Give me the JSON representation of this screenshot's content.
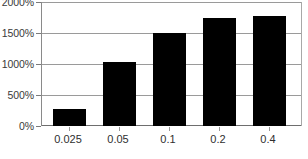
{
  "chart_data": {
    "type": "bar",
    "title": "",
    "subtitle": "",
    "xlabel": "",
    "ylabel": "",
    "categories": [
      "0.025",
      "0.05",
      "0.1",
      "0.2",
      "0.4"
    ],
    "values": [
      270,
      1030,
      1500,
      1750,
      1770
    ],
    "series": [
      {
        "name": "",
        "values": [
          270,
          1030,
          1500,
          1750,
          1770
        ]
      }
    ],
    "ylim": [
      0,
      2000
    ],
    "ytick_values": [
      0,
      500,
      1000,
      1500,
      2000
    ],
    "ytick_labels": [
      "0%",
      "500%",
      "1000%",
      "1500%",
      "2000%"
    ],
    "value_suffix": "%",
    "grid": true,
    "grid_axis": "y",
    "legend": false,
    "legend_position": "none",
    "annotations": [],
    "colors": {
      "bar": "#000000",
      "grid": "#9a9a9a",
      "axis": "#7a7a7a",
      "baseline": "#6e6e6e",
      "ylabel_text": "#3a3a3a",
      "xlabel_text": "#2f2f2f",
      "plot_background": "#ffffff",
      "figure_background": "#ffffff"
    }
  }
}
